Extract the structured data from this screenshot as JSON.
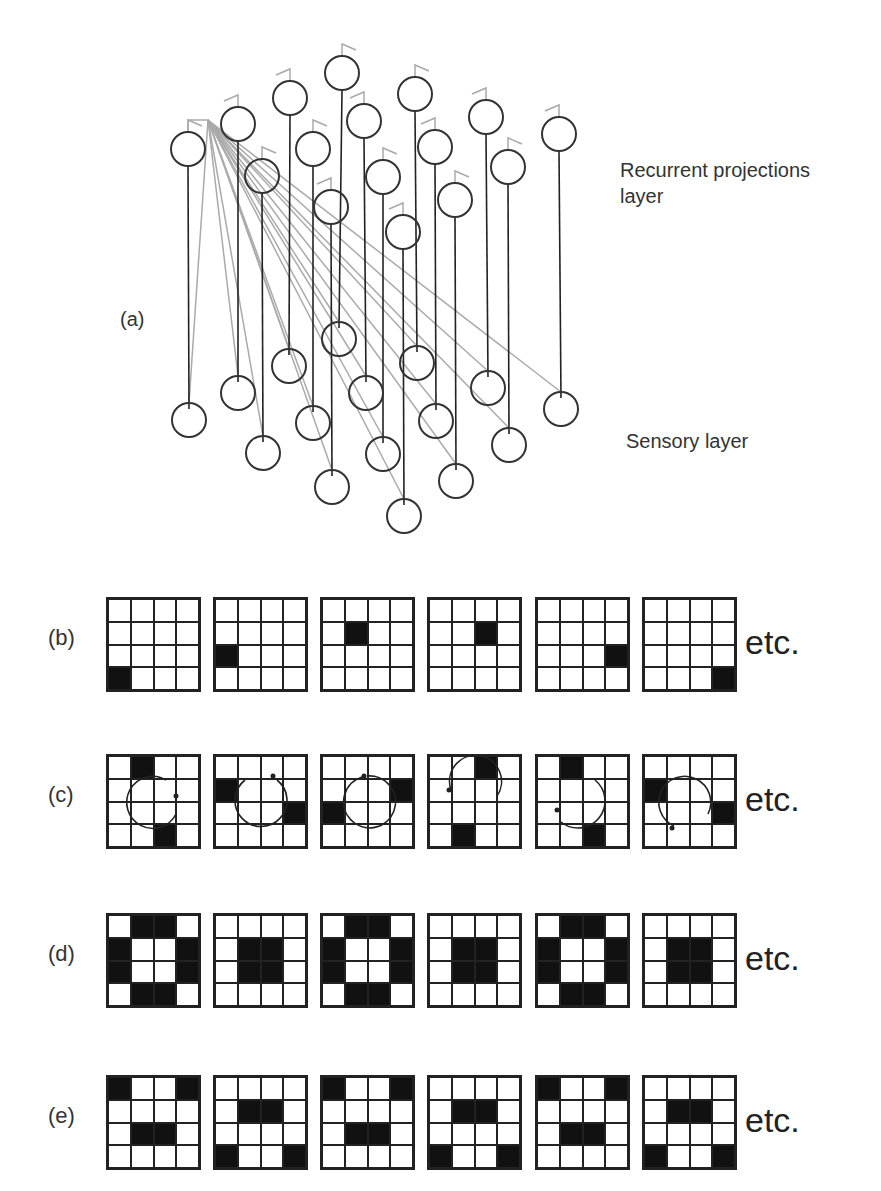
{
  "panel_a": {
    "label": "(a)",
    "top_layer_label_line1": "Recurrent projections",
    "top_layer_label_line2": "layer",
    "bottom_layer_label": "Sensory layer",
    "neuron_radius": 17,
    "colors": {
      "neuron": "#333333",
      "link": "#222222",
      "projection": "#aaaaaa"
    },
    "top_neurons": [
      [
        188,
        149
      ],
      [
        238,
        124
      ],
      [
        262,
        176
      ],
      [
        290,
        98
      ],
      [
        313,
        149
      ],
      [
        331,
        207
      ],
      [
        342,
        73
      ],
      [
        364,
        121
      ],
      [
        383,
        177
      ],
      [
        403,
        232
      ],
      [
        415,
        94
      ],
      [
        435,
        147
      ],
      [
        455,
        200
      ],
      [
        486,
        117
      ],
      [
        508,
        167
      ],
      [
        559,
        134
      ]
    ],
    "bottom_neurons": [
      [
        189,
        420
      ],
      [
        238,
        393
      ],
      [
        263,
        453
      ],
      [
        289,
        366
      ],
      [
        313,
        423
      ],
      [
        332,
        487
      ],
      [
        339,
        339
      ],
      [
        366,
        393
      ],
      [
        383,
        454
      ],
      [
        404,
        516
      ],
      [
        417,
        363
      ],
      [
        436,
        421
      ],
      [
        456,
        481
      ],
      [
        488,
        388
      ],
      [
        509,
        445
      ],
      [
        561,
        409
      ]
    ],
    "projection_origin": [
      208,
      120
    ]
  },
  "rows": [
    {
      "label": "(b)",
      "etc": "etc.",
      "top": 597,
      "grids": [
        {
          "on": [
            12
          ]
        },
        {
          "on": [
            8
          ]
        },
        {
          "on": [
            5
          ]
        },
        {
          "on": [
            6
          ]
        },
        {
          "on": [
            11
          ]
        },
        {
          "on": [
            15
          ]
        }
      ]
    },
    {
      "label": "(c)",
      "etc": "etc.",
      "top": 754,
      "grids": [
        {
          "on": [
            1,
            14
          ],
          "arrow": "cw-right"
        },
        {
          "on": [
            4,
            11
          ],
          "arrow": "cw-top"
        },
        {
          "on": [
            7,
            8
          ],
          "arrow": "ccw-top"
        },
        {
          "on": [
            2,
            13
          ],
          "arrow": "ccw-left"
        },
        {
          "on": [
            1,
            14
          ],
          "arrow": "ccw-left-down"
        },
        {
          "on": [
            4,
            11
          ],
          "arrow": "cw-bottom"
        }
      ]
    },
    {
      "label": "(d)",
      "etc": "etc.",
      "top": 913,
      "grids": [
        {
          "on": [
            1,
            2,
            4,
            7,
            8,
            11,
            13,
            14
          ]
        },
        {
          "on": [
            5,
            6,
            9,
            10
          ]
        },
        {
          "on": [
            1,
            2,
            4,
            7,
            8,
            11,
            13,
            14
          ]
        },
        {
          "on": [
            5,
            6,
            9,
            10
          ]
        },
        {
          "on": [
            1,
            2,
            4,
            7,
            8,
            11,
            13,
            14
          ]
        },
        {
          "on": [
            5,
            6,
            9,
            10
          ]
        }
      ]
    },
    {
      "label": "(e)",
      "etc": "etc.",
      "top": 1075,
      "grids": [
        {
          "on": [
            0,
            3,
            9,
            10
          ]
        },
        {
          "on": [
            5,
            6,
            12,
            15
          ]
        },
        {
          "on": [
            0,
            3,
            9,
            10
          ]
        },
        {
          "on": [
            5,
            6,
            12,
            15
          ]
        },
        {
          "on": [
            0,
            3,
            9,
            10
          ]
        },
        {
          "on": [
            5,
            6,
            12,
            15
          ]
        }
      ]
    }
  ],
  "grid_lefts": [
    106,
    213,
    320,
    427,
    535,
    642
  ]
}
